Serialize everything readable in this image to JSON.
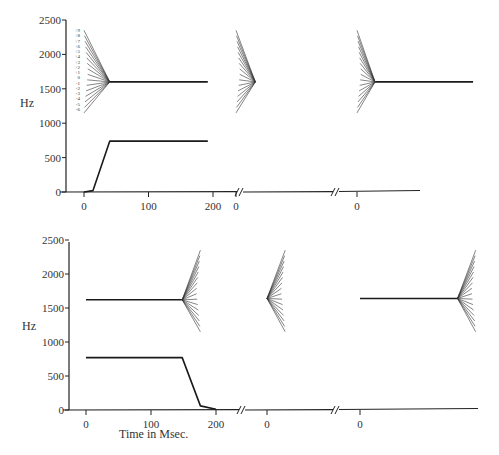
{
  "chart_data": [
    {
      "type": "line",
      "panel": "top",
      "ylabel": "Hz",
      "xlabel": "",
      "yticks": [
        0,
        500,
        1000,
        1500,
        2000,
        2500
      ],
      "ylim": [
        0,
        2500
      ],
      "segments": [
        {
          "xticks": [
            0,
            100,
            200
          ],
          "xlim": [
            -30,
            230
          ],
          "series": [
            {
              "name": "F1",
              "x": [
                0,
                14,
                40,
                192
              ],
              "y": [
                0,
                20,
                740,
                740
              ]
            },
            {
              "name": "F2",
              "x": [
                40,
                192
              ],
              "y": [
                1600,
                1600
              ]
            },
            {
              "name": "F2 transitions",
              "converge": {
                "x": 40,
                "y": 1600
              },
              "start_x": 0,
              "direction": "from-left",
              "start_y_range": [
                2350,
                1150
              ],
              "count": 16
            }
          ],
          "transition_labels": [
            "+9",
            "+8",
            "+7",
            "+6",
            "+5",
            "+4",
            "+3",
            "+2",
            "+1",
            "0",
            "-1",
            "-2",
            "-3",
            "-4",
            "-5",
            "-6"
          ]
        },
        {
          "xticks": [
            0
          ],
          "series": [
            {
              "name": "F2 transitions",
              "converge": {
                "x": 30,
                "y": 1600
              },
              "start_x": 0,
              "direction": "from-left",
              "count": 16
            }
          ]
        },
        {
          "xticks": [
            0
          ],
          "series": [
            {
              "name": "F2 transitions",
              "converge": {
                "x": 28,
                "y": 1600
              },
              "start_x": 0,
              "direction": "from-left",
              "count": 16
            },
            {
              "name": "F2",
              "x": [
                28,
                180
              ],
              "y": [
                1600,
                1600
              ]
            }
          ]
        }
      ]
    },
    {
      "type": "line",
      "panel": "bottom",
      "ylabel": "Hz",
      "xlabel": "Time in Msec.",
      "yticks": [
        0,
        500,
        1000,
        1500,
        2000,
        2500
      ],
      "ylim": [
        0,
        2500
      ],
      "segments": [
        {
          "xticks": [
            0,
            100,
            200
          ],
          "series": [
            {
              "name": "F1",
              "x": [
                0,
                148,
                176,
                200
              ],
              "y": [
                770,
                770,
                60,
                10
              ]
            },
            {
              "name": "F2",
              "x": [
                0,
                148
              ],
              "y": [
                1620,
                1620
              ]
            },
            {
              "name": "F2 transitions",
              "converge": {
                "x": 148,
                "y": 1620
              },
              "end_x": 176,
              "direction": "to-right",
              "count": 16
            }
          ]
        },
        {
          "xticks": [
            0
          ],
          "series": [
            {
              "name": "F2 transitions",
              "converge": {
                "x": 0,
                "y": 1640
              },
              "end_x": 28,
              "direction": "to-right",
              "count": 16
            }
          ]
        },
        {
          "xticks": [
            0
          ],
          "series": [
            {
              "name": "F2",
              "x": [
                0,
                150
              ],
              "y": [
                1640,
                1640
              ]
            },
            {
              "name": "F2 transitions",
              "converge": {
                "x": 150,
                "y": 1640
              },
              "end_x": 178,
              "direction": "to-right",
              "count": 16
            }
          ]
        }
      ]
    }
  ],
  "labels": {
    "y_axis_unit": "Hz",
    "x_axis_title": "Time in Msec.",
    "yticks": [
      "0",
      "500",
      "1000",
      "1500",
      "2000",
      "2500"
    ],
    "xticks_main": [
      "0",
      "100",
      "200"
    ],
    "xtick_zero": "0",
    "transition_labels": [
      "+9",
      "+8",
      "+7",
      "+6",
      "+5",
      "+4",
      "+3",
      "+2",
      "+1",
      "0",
      "-1",
      "-2",
      "-3",
      "-4",
      "-5",
      "-6"
    ]
  },
  "style": {
    "line_color": "#1a1a1a",
    "fan_color": "#333333",
    "axis_color": "#222222",
    "background": "#ffffff"
  }
}
